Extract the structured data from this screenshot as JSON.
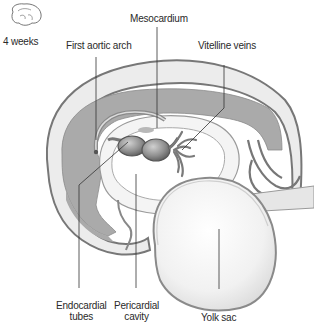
{
  "figure": {
    "type": "embryo-heart-sagittal-section",
    "stage_label": "4 weeks"
  },
  "labels": {
    "stage": "4 weeks",
    "mesocardium": "Mesocardium",
    "first_aortic_arch": "First aortic arch",
    "vitelline_veins": "Vitelline veins",
    "endocardial_tubes_l1": "Endocardial",
    "endocardial_tubes_l2": "tubes",
    "pericardial_cavity_l1": "Pericardial",
    "pericardial_cavity_l2": "cavity",
    "yolk_sac": "Yolk sac"
  },
  "colors": {
    "outline": "#777777",
    "dark_tissue": "#a9a9a9",
    "light_tissue": "#eeeeee",
    "tube": "#8c8c8c",
    "leader_line": "#333333"
  }
}
